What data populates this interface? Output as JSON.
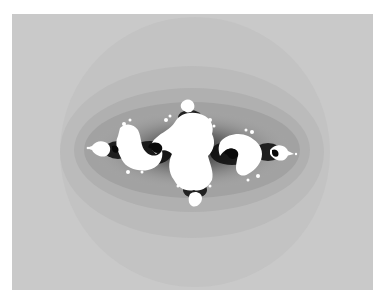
{
  "image": {
    "subject": "Julia set fractal",
    "colors": {
      "background": "#ffffff",
      "outer_field": "#c9c9c9",
      "ring_1": "#c2c2c2",
      "ring_2": "#b8b8b8",
      "ring_3": "#a9a9a9",
      "ring_4": "#8f8f8f",
      "boundary": "#0a0a0a",
      "interior": "#ffffff"
    }
  }
}
